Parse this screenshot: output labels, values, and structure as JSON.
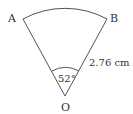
{
  "diagram": {
    "type": "sector",
    "points": {
      "A": "A",
      "B": "B",
      "O": "O"
    },
    "angle_label": "52°",
    "radius_label": "2.76 cm",
    "colors": {
      "stroke": "#555555",
      "text": "#333333"
    }
  }
}
